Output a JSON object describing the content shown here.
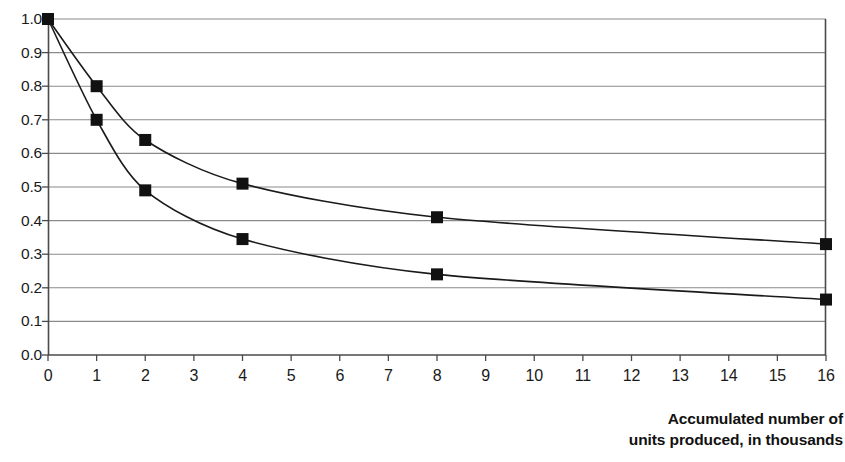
{
  "chart_data": {
    "type": "line",
    "title": "",
    "subtitle": "",
    "xlabel": "Accumulated number of units produced, in thousands",
    "xlabel_line1": "Accumulated number of",
    "xlabel_line2": "units produced, in thousands",
    "ylabel": "",
    "xlim": [
      0,
      16
    ],
    "ylim": [
      0.0,
      1.0
    ],
    "x": [
      0,
      1,
      2,
      4,
      8,
      16
    ],
    "xtick_labels": [
      "0",
      "1",
      "2",
      "3",
      "4",
      "5",
      "6",
      "7",
      "8",
      "9",
      "10",
      "11",
      "12",
      "13",
      "14",
      "15",
      "16"
    ],
    "xtick_values": [
      0,
      1,
      2,
      3,
      4,
      5,
      6,
      7,
      8,
      9,
      10,
      11,
      12,
      13,
      14,
      15,
      16
    ],
    "ytick_labels": [
      "1.0",
      "0.9",
      "0.8",
      "0.7",
      "0.6",
      "0.5",
      "0.4",
      "0.3",
      "0.2",
      "0.1",
      "0.0"
    ],
    "ytick_values": [
      1.0,
      0.9,
      0.8,
      0.7,
      0.6,
      0.5,
      0.4,
      0.3,
      0.2,
      0.1,
      0.0
    ],
    "grid": true,
    "grid_axis": "y",
    "legend": false,
    "legend_position": "none",
    "marker": "filled-square",
    "series": [
      {
        "name": "80% learning curve",
        "values": [
          1.0,
          0.8,
          0.64,
          0.51,
          0.41,
          0.33
        ],
        "color": "#1a1a1a"
      },
      {
        "name": "70% learning curve",
        "values": [
          1.0,
          0.7,
          0.49,
          0.345,
          0.24,
          0.165
        ],
        "color": "#1a1a1a"
      }
    ],
    "colors": {
      "line": "#1a1a1a",
      "marker": "#111111",
      "grid": "#8a8a8a",
      "axis": "#4a4a4a",
      "background": "#ffffff"
    }
  }
}
